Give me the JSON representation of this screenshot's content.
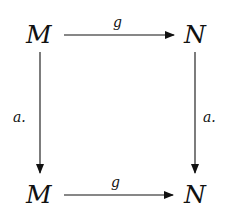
{
  "diagram": {
    "type": "commutative-square",
    "nodes": {
      "top_left": "M",
      "top_right": "N",
      "bottom_left": "M",
      "bottom_right": "N"
    },
    "arrows": {
      "top": {
        "from": "M",
        "to": "N",
        "label": "g"
      },
      "bottom": {
        "from": "M",
        "to": "N",
        "label": "g"
      },
      "left": {
        "from": "M",
        "to": "M",
        "label": "a."
      },
      "right": {
        "from": "N",
        "to": "N",
        "label": "a."
      }
    },
    "colors": {
      "ink": "#111111",
      "background": "#ffffff"
    }
  }
}
